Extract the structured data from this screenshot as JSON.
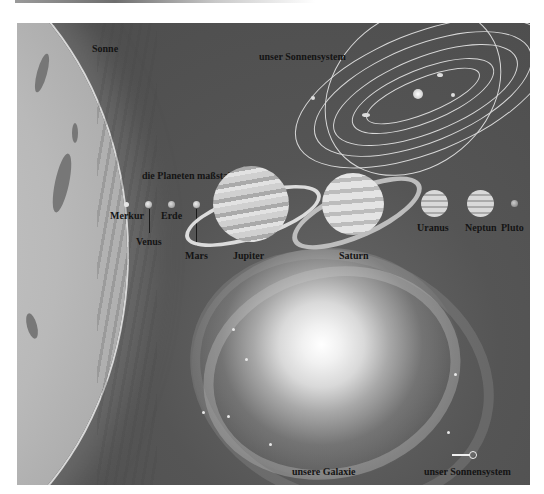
{
  "illustration": {
    "labels": {
      "sun": "Sonne",
      "solar_system_top": "unser Sonnensystem",
      "planets_to_scale": "die Planeten maßstabsgetreu:",
      "galaxy": "unsere Galaxie",
      "solar_system_bottom": "unser Sonnensystem"
    },
    "planets": [
      {
        "name": "Merkur"
      },
      {
        "name": "Venus"
      },
      {
        "name": "Erde"
      },
      {
        "name": "Mars"
      },
      {
        "name": "Jupiter"
      },
      {
        "name": "Saturn"
      },
      {
        "name": "Uranus"
      },
      {
        "name": "Neptun"
      },
      {
        "name": "Pluto"
      }
    ],
    "colors": {
      "background": "#555555",
      "label_text": "#141414",
      "orbit_lines": "#d8d8d8"
    }
  }
}
